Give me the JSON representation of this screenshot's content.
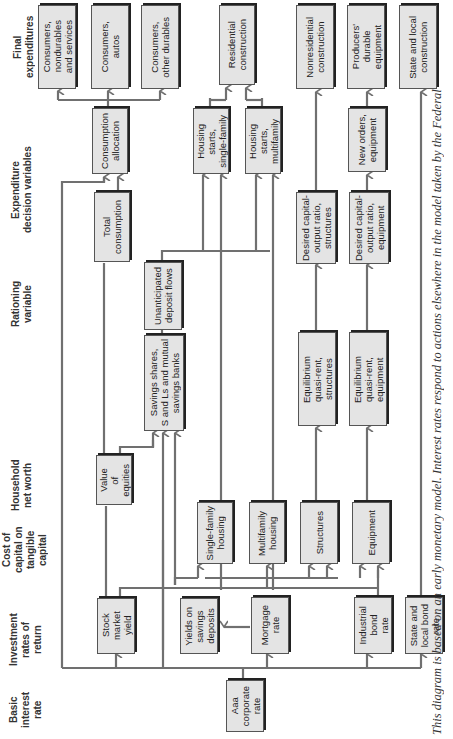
{
  "column_headers": [
    {
      "id": "final",
      "label": "Final\nexpenditures"
    },
    {
      "id": "expenditure",
      "label": "Expenditure\ndecision variables"
    },
    {
      "id": "rationing",
      "label": "Rationing\nvariable"
    },
    {
      "id": "networth",
      "label": "Household\nnet worth"
    },
    {
      "id": "costcap",
      "label": "Cost of\ncapital on\ntangible\ncapital"
    },
    {
      "id": "investment",
      "label": "Investment\nrates of\nreturn"
    },
    {
      "id": "basic",
      "label": "Basic\ninterest\nrate"
    }
  ],
  "boxes": {
    "cons_nondurables": "Consumers,\nnondurables\nand services",
    "cons_autos": "Consumers,\nautos",
    "cons_other": "Consumers,\nother durables",
    "residential": "Residential\nconstruction",
    "nonresidential": "Nonresidential\nconstruction",
    "producers_durable": "Producers'\ndurable\nequipment",
    "state_local_construction": "State and local\nconstruction",
    "consumption_allocation": "Consumption\nallocation",
    "total_consumption": "Total\nconsumption",
    "housing_single": "Housing\nstarts,\nsingle-family",
    "housing_multi": "Housing\nstarts,\nmultifamily",
    "desired_structures": "Desired capital-\noutput ratio,\nstructures",
    "desired_equipment": "Desired capital-\noutput ratio,\nequipment",
    "new_orders": "New orders,\nequipment",
    "unanticipated": "Unanticipated\ndeposit flows",
    "savings_shares": "Savings shares,\nS and Ls and mutual\nsavings banks",
    "equilibrium_structures": "Equilibrium\nquasi-rent,\nstructures",
    "equilibrium_equipment": "Equilibrium\nquasi-rent,\nequipment",
    "value_equities": "Value\nof\nequities",
    "single_family_housing": "Single-family\nhousing",
    "multifamily_housing": "Multifamily\nhousing",
    "structures": "Structures",
    "equipment": "Equipment",
    "stock_market_yield": "Stock\nmarket\nyield",
    "yields_savings": "Yields on\nsavings\ndeposits",
    "mortgage_rate": "Mortgage\nrate",
    "industrial_bond": "Industrial\nbond\nrate",
    "state_local_bond": "State and\nlocal bond\nrate",
    "aaa_corporate": "Aaa\ncorporate\nrate"
  },
  "caption": "This diagram is based on an early monetary model. Interest rates respond to actions elsewhere in the model taken by the Federal",
  "colors": {
    "box_fill": "#e4e4e4",
    "line": "#707070",
    "text": "#222222"
  }
}
